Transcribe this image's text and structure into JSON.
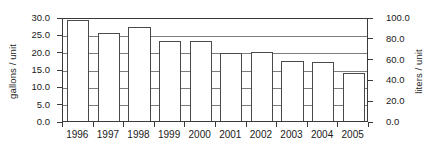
{
  "chart_data": {
    "type": "bar",
    "title": "",
    "subtitle": "",
    "xlabel": "",
    "ylabel": "gallons / unit",
    "y2label": "liters / unit",
    "categories": [
      "1996",
      "1997",
      "1998",
      "1999",
      "2000",
      "2001",
      "2002",
      "2003",
      "2004",
      "2005"
    ],
    "values": [
      29.2,
      25.5,
      27.1,
      23.2,
      23.2,
      19.7,
      19.8,
      17.4,
      17.1,
      13.8
    ],
    "series": [
      {
        "name": "gallons / unit",
        "values": [
          29.2,
          25.5,
          27.1,
          23.2,
          23.2,
          19.7,
          19.8,
          17.4,
          17.1,
          13.8
        ]
      }
    ],
    "ylim": [
      0.0,
      30.0
    ],
    "y2lim": [
      0.0,
      100.0
    ],
    "yticks": [
      "0.0",
      "5.0",
      "10.0",
      "15.0",
      "20.0",
      "25.0",
      "30.0"
    ],
    "ytick_values": [
      0.0,
      5.0,
      10.0,
      15.0,
      20.0,
      25.0,
      30.0
    ],
    "y2ticks": [
      "0.0",
      "20.0",
      "40.0",
      "60.0",
      "80.0",
      "100.0"
    ],
    "y2tick_values": [
      0.0,
      20.0,
      40.0,
      60.0,
      80.0,
      100.0
    ],
    "grid": true,
    "legend": null,
    "legend_position": "none",
    "bar_fill": "#ffffff",
    "bar_edge": "#4a4a4a",
    "grid_color": "#7d7d7d",
    "axis_color": "#3a3a3a"
  }
}
